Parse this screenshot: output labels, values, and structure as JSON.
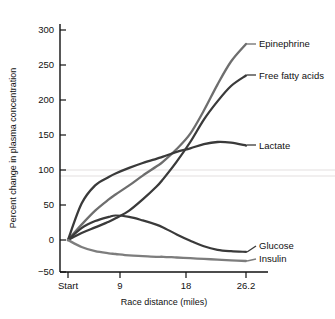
{
  "chart_data": {
    "type": "line",
    "title": "",
    "subtitle": "",
    "xlabel": "Race distance (miles)",
    "ylabel": "Percent change in plasma concentration",
    "grid": false,
    "legend_position": "right-inline-labels",
    "xlim": [
      0,
      26.2
    ],
    "ylim": [
      -50,
      300
    ],
    "x_tick_labels": [
      "Start",
      "9",
      "18",
      "26.2"
    ],
    "x_tick_values": [
      0,
      9,
      18,
      26.2
    ],
    "y_tick_labels": [
      "300",
      "250",
      "200",
      "150",
      "100",
      "50",
      "0",
      "−50"
    ],
    "y_tick_values": [
      300,
      250,
      200,
      150,
      100,
      50,
      0,
      -50
    ],
    "x": [
      0,
      2,
      4,
      6,
      7,
      9,
      11,
      13,
      14,
      16,
      18,
      20,
      22,
      24,
      26.2
    ],
    "series": [
      {
        "name": "Epinephrine",
        "color": "#6e6e6e",
        "values": [
          0,
          22,
          42,
          58,
          65,
          78,
          92,
          105,
          112,
          130,
          152,
          185,
          222,
          255,
          280
        ]
      },
      {
        "name": "Free fatty acids",
        "color": "#3a3a3a",
        "values": [
          0,
          10,
          18,
          26,
          31,
          42,
          58,
          76,
          87,
          112,
          140,
          172,
          198,
          220,
          235
        ]
      },
      {
        "name": "Lactate",
        "color": "#3a3a3a",
        "values": [
          0,
          52,
          78,
          90,
          95,
          103,
          110,
          116,
          119,
          126,
          131,
          137,
          140,
          139,
          135
        ]
      },
      {
        "name": "Glucose",
        "color": "#3a3a3a",
        "values": [
          0,
          17,
          27,
          33,
          35,
          33,
          28,
          22,
          18,
          8,
          -1,
          -9,
          -14,
          -16,
          -17
        ]
      },
      {
        "name": "Insulin",
        "color": "#7d7d7d",
        "values": [
          0,
          -10,
          -16,
          -19,
          -20,
          -22,
          -23,
          -24,
          -24,
          -25,
          -26,
          -27,
          -28,
          -29,
          -30
        ]
      }
    ],
    "series_label_positions": [
      {
        "name": "Epinephrine",
        "x_px": 258,
        "y_px": 44
      },
      {
        "name": "Free fatty acids",
        "x_px": 258,
        "y_px": 77
      },
      {
        "name": "Lactate",
        "x_px": 258,
        "y_px": 146
      },
      {
        "name": "Glucose",
        "x_px": 258,
        "y_px": 245
      },
      {
        "name": "Insulin",
        "x_px": 258,
        "y_px": 259
      }
    ]
  },
  "axes": {
    "y_axis_title": "Percent change in plasma concentration",
    "x_axis_title": "Race distance (miles)"
  },
  "colors": {
    "background": "#ffffff",
    "axis": "#111111",
    "dark_series": "#3a3a3a",
    "gray_series": "#6e6e6e",
    "light_gray_series": "#7d7d7d",
    "faint_gridline": "#eceaea"
  }
}
